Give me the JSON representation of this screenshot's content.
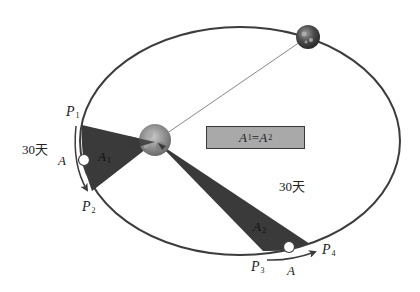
{
  "diagram": {
    "colors": {
      "orbit": "#3c3c3c",
      "wedge": "#3a3a3a",
      "box_fill": "#a9a9a9",
      "box_border": "#3a3a3a",
      "sun": "#8a8a8a",
      "planet": "#555555",
      "marker": "#ffffff"
    },
    "equation": {
      "lhs": "A",
      "lhs_sub": "1",
      "op": "=",
      "rhs": "A",
      "rhs_sub": "2"
    },
    "points": {
      "p1": {
        "letter": "P",
        "sub": "1"
      },
      "p2": {
        "letter": "P",
        "sub": "2"
      },
      "p3": {
        "letter": "P",
        "sub": "3"
      },
      "p4": {
        "letter": "P",
        "sub": "4"
      }
    },
    "areas": {
      "a1": {
        "letter": "A",
        "sub": "1"
      },
      "a2": {
        "letter": "A",
        "sub": "2"
      }
    },
    "planet_label_left": "A",
    "planet_label_bottom": "A",
    "duration_left": "30天",
    "duration_right": "30天",
    "nodes": {
      "sun": "Sun (focus)",
      "earth": "Planet on orbit"
    }
  }
}
